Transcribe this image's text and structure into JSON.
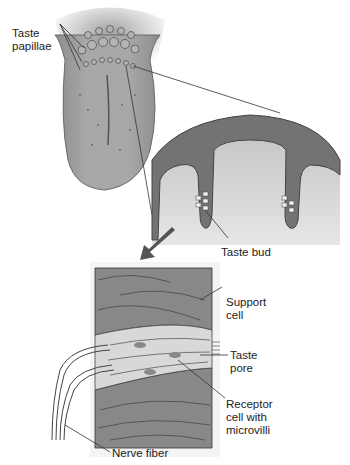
{
  "diagram": {
    "panels": {
      "tongue": "Tongue surface with papillae",
      "cross_section": "Cross-section of papillae showing taste buds",
      "taste_bud": "Enlarged taste bud"
    },
    "labels": {
      "taste_papillae": "Taste\npapillae",
      "taste_bud": "Taste bud",
      "support_cell": "Support\ncell",
      "taste_pore": "Taste\npore",
      "receptor_cell": "Receptor\ncell with\nmicrovilli",
      "nerve_fiber": "Nerve fiber"
    },
    "colors": {
      "tissue_dark": "#6e6e6e",
      "tissue_mid": "#9a9a9a",
      "tissue_light": "#c8c8c8",
      "cell_light": "#e0e0e0",
      "line": "#333333"
    }
  }
}
